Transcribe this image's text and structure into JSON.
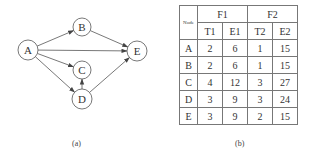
{
  "figure_a": {
    "caption": "(a)",
    "nodes": [
      {
        "id": "A",
        "x": 28,
        "y": 50,
        "r": 10
      },
      {
        "id": "B",
        "x": 82,
        "y": 27,
        "r": 9
      },
      {
        "id": "C",
        "x": 82,
        "y": 70,
        "r": 9
      },
      {
        "id": "D",
        "x": 82,
        "y": 99,
        "r": 10
      },
      {
        "id": "E",
        "x": 137,
        "y": 51,
        "r": 10
      }
    ],
    "edges": [
      {
        "from": "A",
        "to": "B"
      },
      {
        "from": "A",
        "to": "E"
      },
      {
        "from": "A",
        "to": "C"
      },
      {
        "from": "A",
        "to": "D"
      },
      {
        "from": "B",
        "to": "E"
      },
      {
        "from": "D",
        "to": "C"
      },
      {
        "from": "D",
        "to": "E"
      }
    ]
  },
  "figure_b": {
    "caption": "(b)",
    "node_header": "Node",
    "groups": [
      "F1",
      "F2"
    ],
    "subheaders": [
      "T1",
      "E1",
      "T2",
      "E2"
    ],
    "rows": [
      {
        "node": "A",
        "values": [
          "2",
          "6",
          "1",
          "15"
        ]
      },
      {
        "node": "B",
        "values": [
          "2",
          "6",
          "1",
          "15"
        ]
      },
      {
        "node": "C",
        "values": [
          "4",
          "12",
          "3",
          "27"
        ]
      },
      {
        "node": "D",
        "values": [
          "3",
          "9",
          "3",
          "24"
        ]
      },
      {
        "node": "E",
        "values": [
          "3",
          "9",
          "2",
          "15"
        ]
      }
    ]
  }
}
